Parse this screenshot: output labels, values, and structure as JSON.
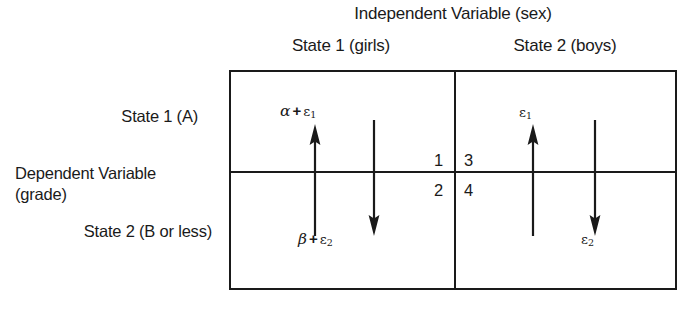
{
  "diagram": {
    "independent_variable_title": "Independent Variable (sex)",
    "columns": [
      {
        "label": "State 1 (girls)"
      },
      {
        "label": "State 2 (boys)"
      }
    ],
    "dependent_variable_label_line1": "Dependent Variable",
    "dependent_variable_label_line2": "(grade)",
    "rows": [
      {
        "label": "State 1 (A)"
      },
      {
        "label": "State 2 (B or less)"
      }
    ],
    "quadrant_numbers": {
      "top_left": "1",
      "top_right": "3",
      "bottom_left": "2",
      "bottom_right": "4"
    },
    "cells": [
      {
        "name": "girls-state1",
        "up_arrow_label_greek": "α",
        "up_arrow_label_plus": "+",
        "up_arrow_label_epsilon": "ε",
        "up_arrow_label_subscript": "1",
        "down_arrow_label_greek": "β",
        "down_arrow_label_plus": "+",
        "down_arrow_label_epsilon": "ε",
        "down_arrow_label_subscript": "2"
      },
      {
        "name": "boys-state2",
        "up_arrow_label_epsilon": "ε",
        "up_arrow_label_subscript": "1",
        "down_arrow_label_epsilon": "ε",
        "down_arrow_label_subscript": "2"
      }
    ],
    "colors": {
      "ink": "#1a1a1a",
      "background": "#ffffff"
    }
  }
}
